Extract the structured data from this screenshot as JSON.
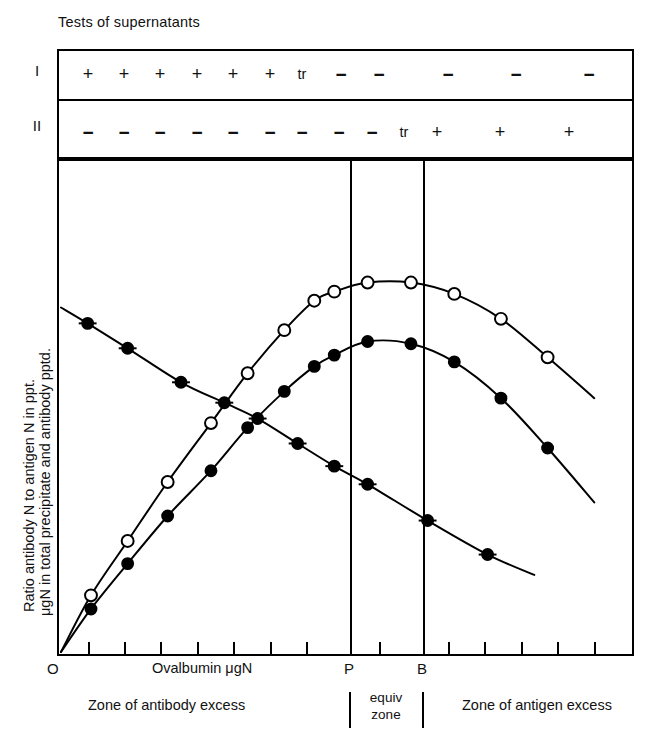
{
  "figure": {
    "title": "Tests of supernatants",
    "y_axis_line1": "Ratio antibody N to antigen N in ppt.",
    "y_axis_line2": "μgN in total precipitate and antibody pptd.",
    "x_axis_label": "Ovalbumin μgN",
    "origin_label": "O",
    "precipitin_marker": "P",
    "b_marker": "B",
    "zone_left": "Zone of antibody excess",
    "zone_equiv_line1": "equiv",
    "zone_equiv_line2": "zone",
    "zone_right": "Zone of antigen excess"
  },
  "supernatant_table": {
    "rows": [
      {
        "label": "I",
        "values": [
          "+",
          "+",
          "+",
          "+",
          "+",
          "+",
          "tr",
          "−",
          "−",
          "−",
          "−",
          "−"
        ]
      },
      {
        "label": "II",
        "values": [
          "−",
          "−",
          "−",
          "−",
          "−",
          "−",
          "−",
          "−",
          "−",
          "tr",
          "+",
          "+",
          "+"
        ]
      }
    ]
  },
  "chart_data": {
    "type": "line",
    "title": "Tests of supernatants",
    "xlabel": "Ovalbumin μgN",
    "ylabel": "Ratio antibody N to antigen N in ppt. / μgN in total precipitate and antibody pptd.",
    "xlim": [
      0,
      16
    ],
    "ylim": [
      0,
      10
    ],
    "grid": false,
    "legend": "none",
    "axis_ticks_x": 14,
    "annotations": [
      {
        "text": "P",
        "x": 8.2,
        "type": "vertical-line"
      },
      {
        "text": "B",
        "x": 10.3,
        "type": "vertical-line"
      }
    ],
    "series": [
      {
        "name": "Total precipitate (open circles)",
        "marker": "open-circle",
        "x": [
          0.0,
          0.9,
          2.0,
          3.2,
          4.5,
          5.6,
          6.7,
          7.6,
          8.2,
          9.2,
          10.5,
          11.8,
          13.2,
          14.6,
          16.0
        ],
        "y": [
          0.0,
          1.25,
          2.45,
          3.75,
          5.05,
          6.15,
          7.1,
          7.75,
          7.95,
          8.15,
          8.15,
          7.9,
          7.35,
          6.5,
          5.6
        ]
      },
      {
        "name": "Antibody precipitated (filled circles)",
        "marker": "filled-circle",
        "x": [
          0.0,
          0.9,
          2.0,
          3.2,
          4.5,
          5.6,
          6.7,
          7.6,
          8.2,
          9.2,
          10.5,
          11.8,
          13.2,
          14.6,
          16.0
        ],
        "y": [
          0.0,
          0.95,
          1.95,
          3.0,
          4.0,
          4.95,
          5.75,
          6.3,
          6.55,
          6.85,
          6.8,
          6.4,
          5.6,
          4.5,
          3.3
        ]
      },
      {
        "name": "Ratio antibody N to antigen N (filled circles, descending)",
        "marker": "filled-circle",
        "x": [
          0.0,
          0.8,
          2.0,
          3.6,
          4.9,
          5.9,
          7.1,
          8.2,
          9.2,
          11.0,
          12.8,
          14.2
        ],
        "y": [
          7.6,
          7.25,
          6.7,
          5.95,
          5.5,
          5.15,
          4.6,
          4.1,
          3.7,
          2.9,
          2.15,
          1.7
        ]
      }
    ]
  }
}
